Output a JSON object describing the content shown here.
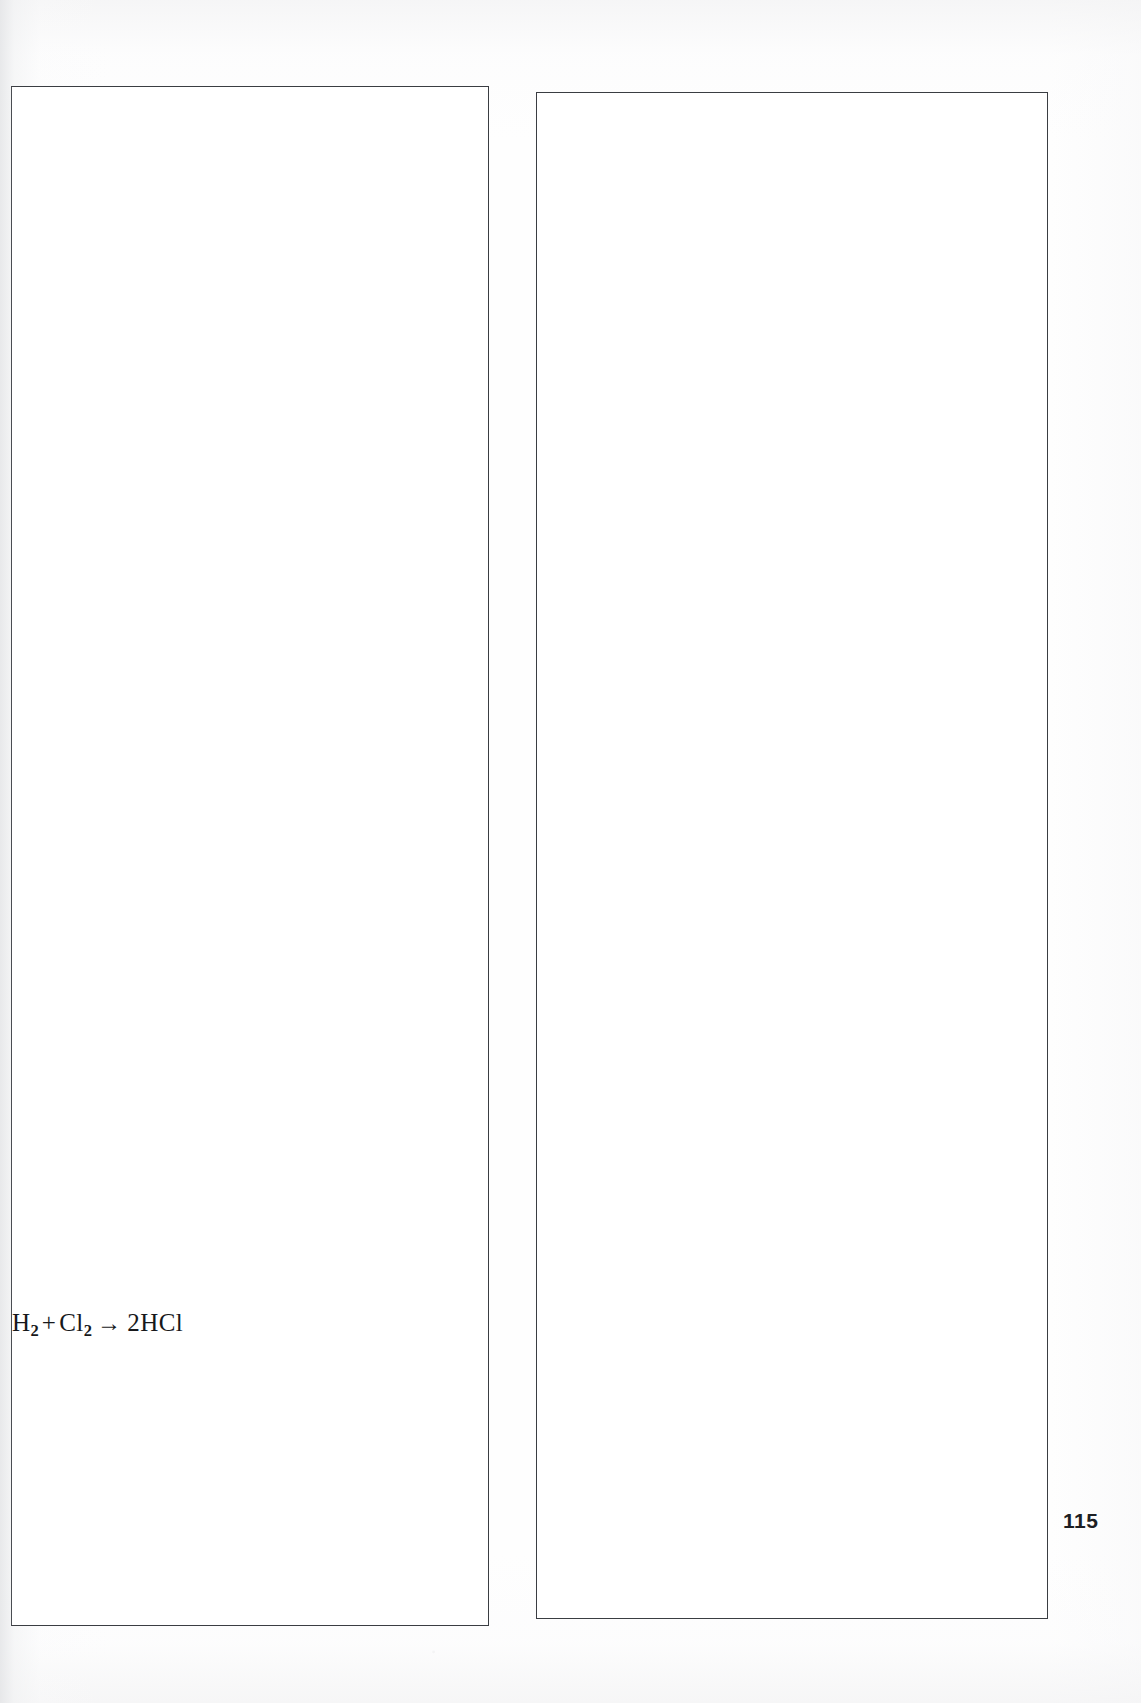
{
  "document": {
    "type": "scanned-textbook-page",
    "page_number": "115",
    "background_color": "#fefefe",
    "rule_color": "#3a3d42"
  },
  "columns": [
    {
      "id": "column-left",
      "content_blocks": [
        {
          "kind": "chemical-equation",
          "text": "H2 + Cl2 -> 2HCl",
          "parts": {
            "reactant_1_symbol": "H",
            "reactant_1_subscript": "2",
            "plus": "+",
            "reactant_2_symbol": "Cl",
            "reactant_2_subscript": "2",
            "arrow": "→",
            "product_coefficient": "2",
            "product_symbol": "HCl"
          }
        }
      ]
    },
    {
      "id": "column-right",
      "content_blocks": []
    }
  ],
  "footer": {
    "page_number": "115"
  }
}
